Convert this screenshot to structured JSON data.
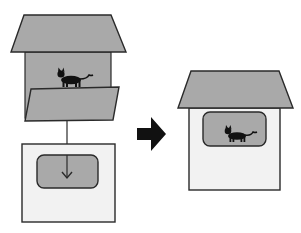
{
  "diagram": {
    "colors": {
      "gray_fill": "#a9a9a9",
      "light_fill": "#f2f2f2",
      "stroke": "#2a2a2a",
      "cat": "#111111",
      "arrow": "#111111",
      "background": "#ffffff"
    },
    "left_scene": {
      "roof": "roof",
      "body": "gray house body with cat",
      "panel": "slanted panel in front",
      "connector": "vertical line to box",
      "box": "box with rounded window and down arrow"
    },
    "transition_arrow": "right arrow",
    "right_scene": {
      "roof": "roof",
      "body": "light house body",
      "window": "rounded window showing cat"
    }
  }
}
